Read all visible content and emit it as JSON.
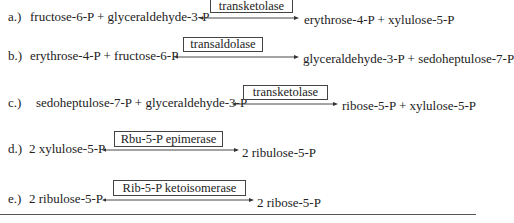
{
  "reactions": [
    {
      "label": "a.)",
      "substrates": "fructose-6-P + glyceraldehyde-3-P",
      "enzyme": "transketolase",
      "products": "erythrose-4-P + xylulose-5-P",
      "arrow": "reversible"
    },
    {
      "label": "b.)",
      "substrates": "erythrose-4-P + fructose-6-P",
      "enzyme": "transaldolase",
      "products": "glyceraldehyde-3-P  + sedoheptulose-7-P",
      "arrow": "reversible"
    },
    {
      "label": "c.)",
      "substrates": "sedoheptulose-7-P + glyceraldehyde-3-P",
      "enzyme": "transketolase",
      "products": "ribose-5-P + xylulose-5-P",
      "arrow": "reversible"
    },
    {
      "label": "d.)",
      "substrates": "2 xylulose-5-P",
      "enzyme": "Rbu-5-P epimerase",
      "products": "2 ribulose-5-P",
      "arrow": "reversible"
    },
    {
      "label": "e.)",
      "substrates": "2 ribulose-5-P",
      "enzyme": "Rib-5-P ketoisomerase",
      "products": "2 ribose-5-P",
      "arrow": "reversible"
    }
  ],
  "colors": {
    "text": "#222222",
    "border": "#444444",
    "background": "#ffffff"
  }
}
